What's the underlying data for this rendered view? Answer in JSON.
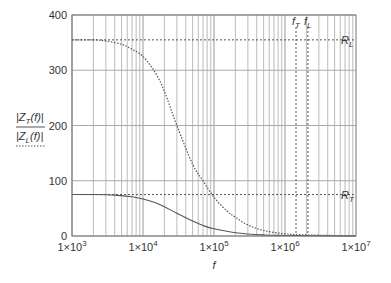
{
  "chart_data": {
    "type": "line",
    "title": "",
    "xlabel": "f",
    "ylabel": "|Z_T(f)| / |Z_L(f)|",
    "xscale": "log",
    "xlim": [
      1000,
      10000000
    ],
    "ylim": [
      0,
      400
    ],
    "x_ticks": [
      {
        "value": 1000,
        "label_base": "1×10",
        "label_exp": "3"
      },
      {
        "value": 10000,
        "label_base": "1×10",
        "label_exp": "4"
      },
      {
        "value": 100000,
        "label_base": "1×10",
        "label_exp": "5"
      },
      {
        "value": 1000000,
        "label_base": "1×10",
        "label_exp": "6"
      },
      {
        "value": 10000000,
        "label_base": "1×10",
        "label_exp": "7"
      }
    ],
    "y_ticks": [
      0,
      100,
      200,
      300,
      400
    ],
    "grid": true,
    "legend": [
      {
        "label_main": "|Z",
        "label_sub": "T",
        "label_tail": "(f)|",
        "style": "solid"
      },
      {
        "label_main": "|Z",
        "label_sub": "L",
        "label_tail": "(f)|",
        "style": "dotted"
      }
    ],
    "series": [
      {
        "name": "|Z_T(f)|",
        "style": "solid",
        "color": "#555555",
        "x": [
          1000,
          2000,
          4000,
          7000,
          10000,
          15000,
          20000,
          30000,
          50000,
          70000,
          100000,
          200000,
          500000,
          1000000,
          10000000
        ],
        "y": [
          75,
          75,
          74,
          71,
          67,
          60,
          53,
          41,
          27,
          19,
          13,
          6,
          2,
          1,
          0
        ]
      },
      {
        "name": "|Z_L(f)|",
        "style": "dotted",
        "color": "#555555",
        "x": [
          1000,
          2000,
          3000,
          5000,
          7000,
          10000,
          15000,
          20000,
          30000,
          50000,
          70000,
          100000,
          150000,
          200000,
          300000,
          500000,
          1000000,
          2000000,
          10000000
        ],
        "y": [
          355,
          355,
          353,
          347,
          338,
          325,
          295,
          262,
          200,
          130,
          100,
          70,
          46,
          34,
          20,
          10,
          4,
          2,
          0
        ]
      }
    ],
    "annotations": [
      {
        "type": "hline",
        "y": 355,
        "style": "dotted",
        "label_main": "R",
        "label_sub": "L"
      },
      {
        "type": "hline",
        "y": 75,
        "style": "dotted",
        "label_main": "R",
        "label_sub": "T"
      },
      {
        "type": "vline",
        "x": 1430000,
        "style": "dotted",
        "label_main": "f",
        "label_sub": "T"
      },
      {
        "type": "vline",
        "x": 2100000,
        "style": "dotted",
        "label_main": "f",
        "label_sub": "L"
      }
    ]
  }
}
